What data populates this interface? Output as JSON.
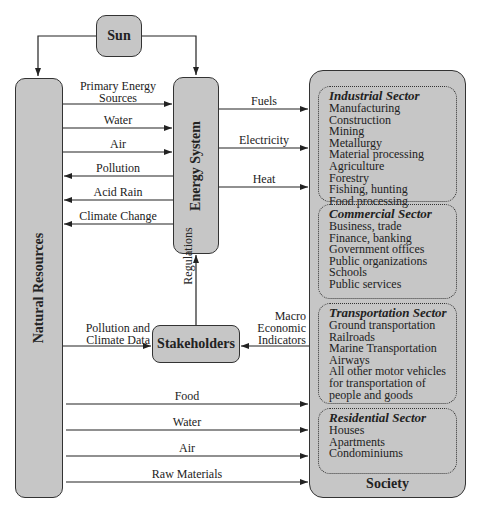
{
  "nodes": {
    "sun": "Sun",
    "natural_resources": "Natural Resources",
    "energy_system": "Energy System",
    "stakeholders": "Stakeholders",
    "society": "Society"
  },
  "flows": {
    "natural_to_energy": [
      "Primary Energy\nSources",
      "Water",
      "Air"
    ],
    "energy_to_natural": [
      "Pollution",
      "Acid Rain",
      "Climate Change"
    ],
    "energy_to_society": [
      "Fuels",
      "Electricity",
      "Heat"
    ],
    "stakeholders_to_energy": "Regulations",
    "natural_to_stakeholders": "Pollution and\nClimate Data",
    "society_to_stakeholders": "Macro\nEconomic\nIndicators",
    "natural_to_society": [
      "Food",
      "Water",
      "Air",
      "Raw Materials"
    ]
  },
  "sectors": [
    {
      "title": "Industrial Sector",
      "items": [
        "Manufacturing",
        "Construction",
        "Mining",
        "Metallurgy",
        "Material processing",
        "Agriculture",
        "Forestry",
        "Fishing, hunting",
        "Food processing"
      ]
    },
    {
      "title": "Commercial Sector",
      "items": [
        "Business, trade",
        "Finance, banking",
        "Government offices",
        "Public organizations",
        "Schools",
        "Public services"
      ]
    },
    {
      "title": "Transportation Sector",
      "items": [
        "Ground transportation",
        "Railroads",
        "Marine Transportation",
        "Airways",
        "All other motor vehicles",
        "for transportation of",
        "people and goods"
      ]
    },
    {
      "title": "Residential Sector",
      "items": [
        "Houses",
        "Apartments",
        "Condominiums"
      ]
    }
  ]
}
